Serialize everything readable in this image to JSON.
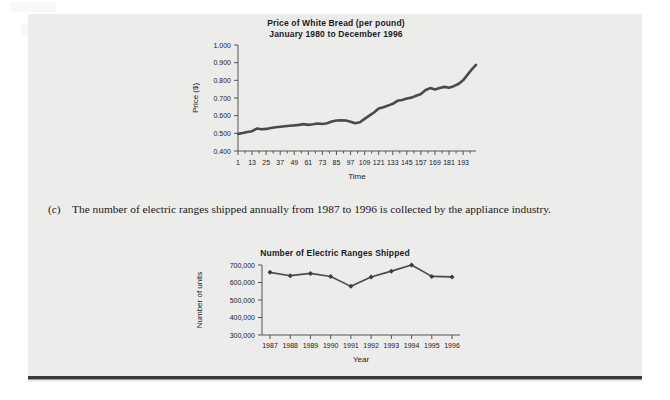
{
  "page": {
    "background_color": "#ececeb",
    "text_color": "#1a1a1a"
  },
  "paragraph_c": {
    "marker": "(c)",
    "text": "The number of electric ranges shipped annually from 1987 to 1996 is collected by the appliance industry."
  },
  "chart_data": [
    {
      "id": "white-bread-price",
      "type": "line",
      "title": "Price of White Bread (per pound)",
      "subtitle": "January 1980 to December 1996",
      "xlabel": "Time",
      "ylabel": "Price ($)",
      "ylim": [
        0.4,
        1.0
      ],
      "ytick_labels": [
        "1.000",
        "0.900",
        "0.800",
        "0.700",
        "0.600",
        "0.500",
        "0.400"
      ],
      "ytick_values": [
        1.0,
        0.9,
        0.8,
        0.7,
        0.6,
        0.5,
        0.4
      ],
      "xlim": [
        1,
        204
      ],
      "xtick_labels": [
        "1",
        "13",
        "25",
        "37",
        "49",
        "61",
        "73",
        "85",
        "97",
        "109",
        "121",
        "133",
        "145",
        "157",
        "169",
        "181",
        "193"
      ],
      "xtick_values": [
        1,
        13,
        25,
        37,
        49,
        61,
        73,
        85,
        97,
        109,
        121,
        133,
        145,
        157,
        169,
        181,
        193
      ],
      "grid": false,
      "legend": "none",
      "line_color": "#4a4a4a",
      "x": [
        1,
        5,
        9,
        13,
        17,
        21,
        25,
        29,
        33,
        37,
        41,
        45,
        49,
        53,
        57,
        61,
        65,
        69,
        73,
        77,
        81,
        85,
        89,
        93,
        97,
        101,
        105,
        109,
        113,
        117,
        121,
        125,
        129,
        133,
        137,
        141,
        145,
        149,
        153,
        157,
        161,
        165,
        169,
        173,
        177,
        181,
        185,
        189,
        193,
        197,
        201,
        204
      ],
      "values": [
        0.497,
        0.502,
        0.508,
        0.512,
        0.527,
        0.523,
        0.525,
        0.53,
        0.534,
        0.537,
        0.54,
        0.543,
        0.545,
        0.548,
        0.552,
        0.548,
        0.551,
        0.556,
        0.553,
        0.557,
        0.567,
        0.573,
        0.574,
        0.573,
        0.566,
        0.557,
        0.563,
        0.582,
        0.6,
        0.618,
        0.641,
        0.648,
        0.657,
        0.667,
        0.684,
        0.689,
        0.697,
        0.702,
        0.713,
        0.723,
        0.745,
        0.756,
        0.748,
        0.757,
        0.763,
        0.758,
        0.767,
        0.779,
        0.8,
        0.834,
        0.866,
        0.888
      ]
    },
    {
      "id": "electric-ranges-shipped",
      "type": "line",
      "title": "Number of Electric Ranges Shipped",
      "subtitle": "",
      "xlabel": "Year",
      "ylabel": "Number of units",
      "ylim": [
        300000,
        700000
      ],
      "ytick_labels": [
        "700,000",
        "600,000",
        "500,000",
        "400,000",
        "300,000"
      ],
      "ytick_values": [
        700000,
        600000,
        500000,
        400000,
        300000
      ],
      "categories": [
        "1987",
        "1988",
        "1989",
        "1990",
        "1991",
        "1992",
        "1993",
        "1994",
        "1995",
        "1996"
      ],
      "values": [
        658000,
        639000,
        652000,
        634000,
        578000,
        631000,
        665000,
        700000,
        635000,
        632000
      ],
      "grid": false,
      "legend": "none",
      "line_color": "#4a4a4a",
      "marker": "diamond"
    }
  ]
}
